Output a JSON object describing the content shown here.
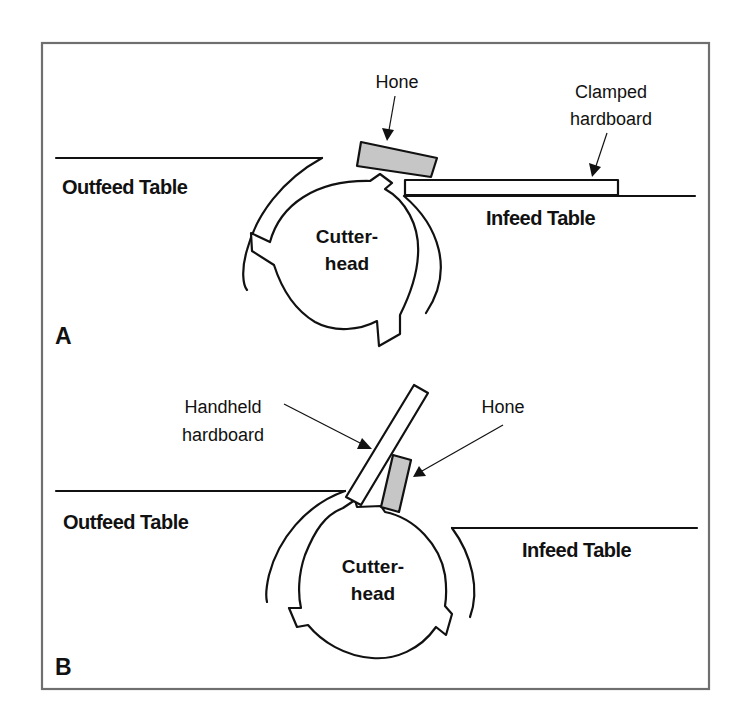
{
  "figure": {
    "colors": {
      "frame": "#6f6f6f",
      "ink": "#111111",
      "hone_fill": "#c6c6c6",
      "background": "#ffffff"
    },
    "panels": [
      {
        "id": "A",
        "panel_label": "A",
        "outfeed_label": "Outfeed Table",
        "infeed_label": "Infeed Table",
        "cutterhead_label_line1": "Cutter-",
        "cutterhead_label_line2": "head",
        "hone_label": "Hone",
        "board_label_line1": "Clamped",
        "board_label_line2": "hardboard"
      },
      {
        "id": "B",
        "panel_label": "B",
        "outfeed_label": "Outfeed Table",
        "infeed_label": "Infeed Table",
        "cutterhead_label_line1": "Cutter-",
        "cutterhead_label_line2": "head",
        "hone_label": "Hone",
        "board_label_line1": "Handheld",
        "board_label_line2": "hardboard"
      }
    ]
  }
}
